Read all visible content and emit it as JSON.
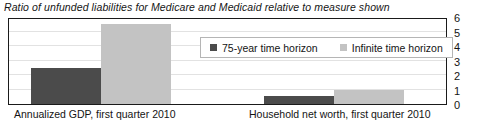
{
  "chart": {
    "title": "Ratio of unfunded liabilities for Medicare and Medicaid relative to measure shown"
  },
  "legend": {
    "items": [
      {
        "label": "75-year time horizon",
        "color": "#4b4b4b"
      },
      {
        "label": "Infinite time horizon",
        "color": "#c3c3c3"
      }
    ]
  },
  "yaxis": {
    "ticks": [
      "6",
      "5",
      "4",
      "3",
      "2",
      "1",
      "0"
    ]
  },
  "xaxis": {
    "labels": [
      "Annualized GDP, first quarter 2010",
      "Household net worth, first quarter 2010"
    ]
  },
  "chart_data": {
    "type": "bar",
    "title": "Ratio of unfunded liabilities for Medicare and Medicaid relative to measure shown",
    "xlabel": "",
    "ylabel": "",
    "ylim": [
      0,
      6
    ],
    "yticks": [
      0,
      1,
      2,
      3,
      4,
      5,
      6
    ],
    "grid": true,
    "legend_position": "top-center",
    "yaxis_side": "right",
    "categories": [
      "Annualized GDP, first quarter 2010",
      "Household net worth, first quarter 2010"
    ],
    "series": [
      {
        "name": "75-year time horizon",
        "color": "#4b4b4b",
        "values": [
          2.5,
          0.55
        ]
      },
      {
        "name": "Infinite time horizon",
        "color": "#c3c3c3",
        "values": [
          5.5,
          1.0
        ]
      }
    ]
  },
  "geometry": {
    "bars": [
      {
        "name": "gdp-75year",
        "left": 22,
        "width": 70,
        "value": 2.5,
        "tone": "dark"
      },
      {
        "name": "gdp-infinite",
        "left": 92,
        "width": 70,
        "value": 5.5,
        "tone": "light"
      },
      {
        "name": "networth-75year",
        "left": 255,
        "width": 70,
        "value": 0.55,
        "tone": "dark"
      },
      {
        "name": "networth-infinite",
        "left": 325,
        "width": 70,
        "value": 1.0,
        "tone": "light"
      }
    ]
  }
}
